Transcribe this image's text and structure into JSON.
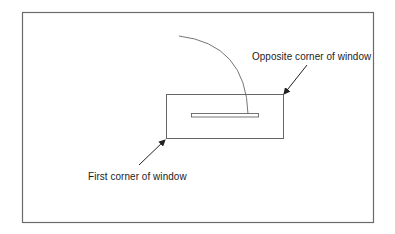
{
  "diagram": {
    "type": "zoom-window-illustration",
    "labels": {
      "opposite_corner": "Opposite corner of window",
      "first_corner": "First corner of window"
    },
    "colors": {
      "background": "#ffffff",
      "frame": "#6a6a6a",
      "lines": "#555555",
      "arrows": "#222222",
      "text": "#222222"
    },
    "elements": {
      "outer_frame": {
        "x": 22,
        "y": 12,
        "width": 351,
        "height": 210
      },
      "selection_window": {
        "x": 166,
        "y": 94,
        "width": 117,
        "height": 44
      },
      "drawing_slot": {
        "x": 191,
        "y": 113,
        "width": 67,
        "height": 4
      },
      "arc": {
        "start": [
          179,
          36
        ],
        "end": [
          248,
          113
        ]
      },
      "arrow_opposite": {
        "from": [
          307,
          65
        ],
        "to": [
          283,
          94
        ]
      },
      "arrow_first": {
        "from": [
          139,
          165
        ],
        "to": [
          166,
          139
        ]
      }
    }
  }
}
